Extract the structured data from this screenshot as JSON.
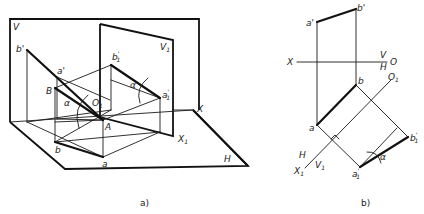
{
  "figure_a": {
    "caption": "a)",
    "planes": {
      "V": "V",
      "V1": "V",
      "V1_sub": "1",
      "H": "H"
    },
    "axes": {
      "X": "X",
      "X1": "X",
      "X1_sub": "1"
    },
    "points": {
      "b_prime": "b'",
      "a_prime": "a'",
      "B": "B",
      "A": "A",
      "O1": "O",
      "O1_sub": "1",
      "b": "b",
      "a": "a",
      "b1_prime": "b",
      "b1_prime_sub": "1",
      "b1_prime_sup": "'",
      "a1_prime": "a",
      "a1_prime_sub": "1",
      "a1_prime_sup": "'",
      "alpha1": "α",
      "alpha2": "α"
    }
  },
  "figure_b": {
    "caption": "b)",
    "axes": {
      "X": "X",
      "O": "O",
      "V": "V",
      "H": "H",
      "H2": "H",
      "V1": "V",
      "V1_sub": "1",
      "X1": "X",
      "X1_sub": "1",
      "O1": "O",
      "O1_sub": "1"
    },
    "points": {
      "a_prime": "a'",
      "b_prime": "b'",
      "b": "b",
      "a": "a",
      "b1_prime": "b",
      "b1_prime_sub": "1",
      "b1_prime_sup": "'",
      "a1_prime": "a",
      "a1_prime_sub": "1",
      "a1_prime_sup": "'",
      "alpha": "α"
    }
  }
}
